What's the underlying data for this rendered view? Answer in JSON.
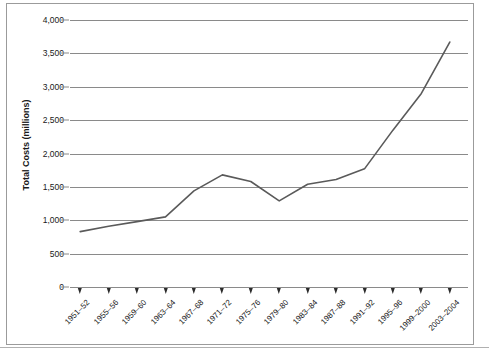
{
  "chart_data": {
    "type": "line",
    "title": "",
    "xlabel": "",
    "ylabel": "Total Costs (millions)",
    "ylim": [
      0,
      4000
    ],
    "ytick_labels": [
      "4,000",
      "3,500",
      "3,000",
      "2,500",
      "2,000",
      "1,500",
      "1,000",
      "500",
      "0"
    ],
    "ytick_values": [
      4000,
      3500,
      3000,
      2500,
      2000,
      1500,
      1000,
      500,
      0
    ],
    "grid": "horizontal",
    "legend": "none",
    "line_color": "#5a5a5a",
    "categories": [
      "1951–52",
      "1955–56",
      "1959–60",
      "1963–64",
      "1967–68",
      "1971–72",
      "1975–76",
      "1979–80",
      "1983–84",
      "1987–88",
      "1991–92",
      "1995–96",
      "1999–2000",
      "2003–2004"
    ],
    "values": [
      830,
      910,
      980,
      1050,
      1440,
      1680,
      1580,
      1290,
      1540,
      1610,
      1770,
      2350,
      2900,
      3670
    ]
  }
}
